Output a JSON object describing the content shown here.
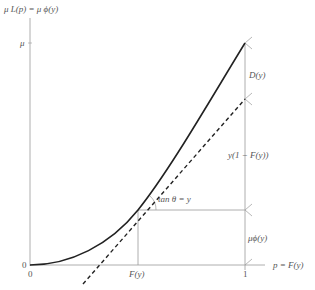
{
  "diagram": {
    "y_axis_title": "μ L(p) = μ ϕ(y)",
    "x_axis_title": "p = F(y)",
    "y_tick_mu": "μ",
    "y_tick_zero": "0",
    "x_tick_zero": "0",
    "x_tick_fy": "F(y)",
    "x_tick_one": "1",
    "angle_label": "tan θ = y",
    "brace_labels": {
      "top": "D(y)",
      "middle": "y(1 − F(y))",
      "bottom": "μϕ(y)"
    },
    "curves": {
      "lorenz": "solid convex curve from (0,0) to (1,μ)",
      "tangent": "dashed tangent line at p = F(y) with slope y"
    },
    "colors": {
      "curve": "#222222",
      "axis": "#999999",
      "text": "#555555"
    }
  }
}
